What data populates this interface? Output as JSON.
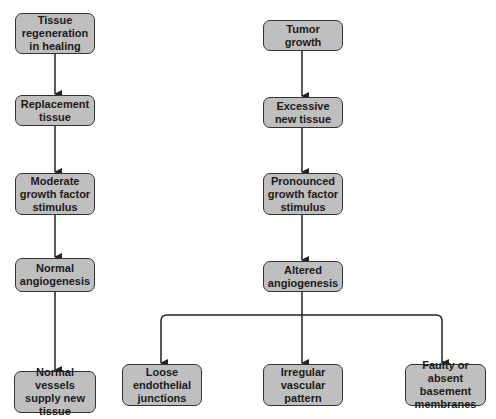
{
  "diagram": {
    "type": "flowchart",
    "colors": {
      "node_fill": "#bfbfbf",
      "node_border": "#333333",
      "edge": "#222222",
      "text": "#1a1a1a"
    },
    "left_column": {
      "nodes": [
        {
          "id": "tissue-regeneration",
          "label": "Tissue regeneration in healing"
        },
        {
          "id": "replacement-tissue",
          "label": "Replacement tissue"
        },
        {
          "id": "moderate-gf",
          "label": "Moderate growth factor stimulus"
        },
        {
          "id": "normal-angiogenesis",
          "label": "Normal angiogenesis"
        },
        {
          "id": "normal-vessels",
          "label": "Normal vessels supply new tissue"
        }
      ]
    },
    "right_column": {
      "nodes": [
        {
          "id": "tumor-growth",
          "label": "Tumor growth"
        },
        {
          "id": "excessive-tissue",
          "label": "Excessive new tissue"
        },
        {
          "id": "pronounced-gf",
          "label": "Pronounced growth factor stimulus"
        },
        {
          "id": "altered-angiogenesis",
          "label": "Altered angiogenesis"
        }
      ],
      "outcomes": [
        {
          "id": "loose-junctions",
          "label": "Loose endothelial junctions"
        },
        {
          "id": "irregular-pattern",
          "label": "Irregular vascular pattern"
        },
        {
          "id": "faulty-membranes",
          "label": "Faulty or absent basement membranes"
        }
      ]
    },
    "edges": [
      [
        "tissue-regeneration",
        "replacement-tissue"
      ],
      [
        "replacement-tissue",
        "moderate-gf"
      ],
      [
        "moderate-gf",
        "normal-angiogenesis"
      ],
      [
        "normal-angiogenesis",
        "normal-vessels"
      ],
      [
        "tumor-growth",
        "excessive-tissue"
      ],
      [
        "excessive-tissue",
        "pronounced-gf"
      ],
      [
        "pronounced-gf",
        "altered-angiogenesis"
      ],
      [
        "altered-angiogenesis",
        "loose-junctions"
      ],
      [
        "altered-angiogenesis",
        "irregular-pattern"
      ],
      [
        "altered-angiogenesis",
        "faulty-membranes"
      ]
    ]
  }
}
